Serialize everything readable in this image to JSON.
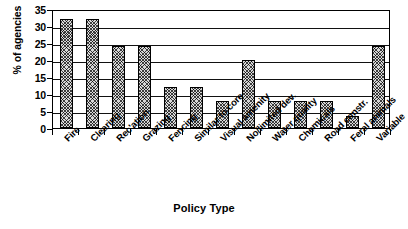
{
  "chart_data": {
    "type": "bar",
    "title": "",
    "xlabel": "Policy Type",
    "ylabel": "% of agencies",
    "ylim": [
      0,
      35
    ],
    "ytick_step": 5,
    "yticks": [
      35,
      30,
      25,
      20,
      15,
      10,
      5,
      0
    ],
    "grid": true,
    "legend": false,
    "bar_style": {
      "fill": "#d8d8d8",
      "hatch": "cross-hatch",
      "edge": "#000000"
    },
    "categories": [
      "Fire",
      "Clearing",
      "Rec'ation",
      "Grazing",
      "Fencing",
      "Similar to core",
      "Visual amenity",
      "No/limited dev.",
      "Water quality",
      "Chemicals",
      "Road constr.",
      "Feral animals",
      "Variable"
    ],
    "values": [
      32,
      32,
      24,
      24,
      12,
      12,
      8,
      20,
      8,
      8,
      8,
      3.5,
      24
    ]
  }
}
